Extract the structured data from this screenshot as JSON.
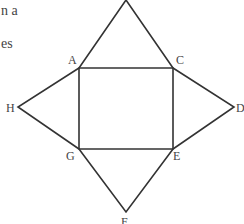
{
  "text_fragments": [
    {
      "text": "n a",
      "x": 1,
      "y": 3
    },
    {
      "text": "es",
      "x": 1,
      "y": 36
    }
  ],
  "diagram": {
    "stroke_color": "#333333",
    "points": {
      "top": [
        126,
        0
      ],
      "A": [
        79,
        68
      ],
      "C": [
        173,
        68
      ],
      "G": [
        79,
        149
      ],
      "E": [
        173,
        149
      ],
      "H": [
        18,
        107
      ],
      "D": [
        234,
        107
      ],
      "F": [
        126,
        212
      ]
    },
    "labels": {
      "A": "A",
      "C": "C",
      "G": "G",
      "E": "E",
      "H": "H",
      "D": "D",
      "F": "F"
    }
  }
}
